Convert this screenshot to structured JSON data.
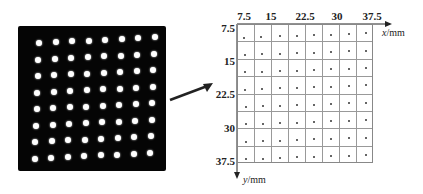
{
  "photo": {
    "rows": 8,
    "cols": 8,
    "description": "Dot-array calibration target photo"
  },
  "grid": {
    "x_ticks": [
      "7.5",
      "15",
      "22.5",
      "30",
      "37.5"
    ],
    "y_ticks": [
      "7.5",
      "15",
      "22.5",
      "30",
      "37.5"
    ],
    "x_label": "x",
    "x_unit": "/mm",
    "y_label": "y",
    "y_unit": "/mm",
    "cells": 8,
    "colors": {
      "background": "#ffffff",
      "photo": "#050505",
      "spot": "#ffffff",
      "line": "#999999"
    }
  }
}
